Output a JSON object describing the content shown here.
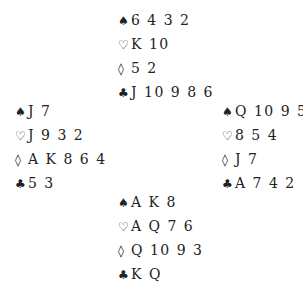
{
  "suits": {
    "spades": "♠",
    "hearts": "♡",
    "diamonds": "◊",
    "clubs": "♣"
  },
  "hands": {
    "north": {
      "spades": "6 4 3 2",
      "hearts": "K 10",
      "diamonds": "5 2",
      "clubs": "J 10 9 8 6"
    },
    "west": {
      "spades": "J 7",
      "hearts": "J 9 3 2",
      "diamonds": "A K 8 6 4",
      "clubs": "5 3"
    },
    "east": {
      "spades": "Q 10 9 5",
      "hearts": "8 5 4",
      "diamonds": "J 7",
      "clubs": "A 7 4 2"
    },
    "south": {
      "spades": "A K 8",
      "hearts": "A Q 7 6",
      "diamonds": "Q 10 9 3",
      "clubs": "K Q"
    }
  }
}
